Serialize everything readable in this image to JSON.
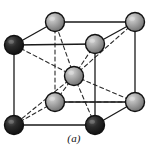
{
  "figure": {
    "caption": "(a)",
    "background_color": "#ffffff",
    "edge_color": "#1a1a1a",
    "hidden_edge_color": "#2a2a2a",
    "solid_edge_width": 1.3,
    "dashed_edge_width": 1.1,
    "dash_pattern": "4,3",
    "atom_outline_color": "#111111",
    "atom_fill_light": "#b3b3b3",
    "atom_fill_dark": "#1f1f1f",
    "atom_highlight_color": "#e0e0e0",
    "atom_radius": 9.5,
    "center_atom_radius": 9.5
  },
  "atoms": [
    {
      "id": "top-back-left",
      "name": "corner-atom-top-back-left",
      "cx": 55,
      "cy": 22,
      "shade": "light",
      "r": 9.5
    },
    {
      "id": "top-back-right",
      "name": "corner-atom-top-back-right",
      "cx": 135,
      "cy": 22,
      "shade": "light",
      "r": 9.5
    },
    {
      "id": "top-front-left",
      "name": "corner-atom-top-front-left",
      "cx": 14,
      "cy": 45,
      "shade": "dark",
      "r": 9.5
    },
    {
      "id": "top-front-right",
      "name": "corner-atom-top-front-right",
      "cx": 95,
      "cy": 44,
      "shade": "light",
      "r": 9.5
    },
    {
      "id": "body-center",
      "name": "body-center-atom",
      "cx": 74,
      "cy": 76,
      "shade": "light",
      "r": 9.5
    },
    {
      "id": "bottom-back-left",
      "name": "corner-atom-bottom-back-left",
      "cx": 55,
      "cy": 102,
      "shade": "light",
      "r": 9.5
    },
    {
      "id": "bottom-back-right",
      "name": "corner-atom-bottom-back-right",
      "cx": 135,
      "cy": 102,
      "shade": "light",
      "r": 9.5
    },
    {
      "id": "bottom-front-left",
      "name": "corner-atom-bottom-front-left",
      "cx": 14,
      "cy": 125,
      "shade": "dark",
      "r": 9.5
    },
    {
      "id": "bottom-front-right",
      "name": "corner-atom-bottom-front-right",
      "cx": 95,
      "cy": 125,
      "shade": "dark",
      "r": 9.5
    }
  ],
  "edges_solid": [
    {
      "name": "edge-top-back",
      "x1": 55,
      "y1": 22,
      "x2": 135,
      "y2": 22
    },
    {
      "name": "edge-top-left-diagonal",
      "x1": 14,
      "y1": 45,
      "x2": 55,
      "y2": 22
    },
    {
      "name": "edge-top-front",
      "x1": 14,
      "y1": 45,
      "x2": 95,
      "y2": 44
    },
    {
      "name": "edge-top-right-diagonal",
      "x1": 95,
      "y1": 44,
      "x2": 135,
      "y2": 22
    },
    {
      "name": "edge-vertical-front-left",
      "x1": 14,
      "y1": 45,
      "x2": 14,
      "y2": 125
    },
    {
      "name": "edge-vertical-front-right",
      "x1": 95,
      "y1": 44,
      "x2": 95,
      "y2": 125
    },
    {
      "name": "edge-vertical-back-right",
      "x1": 135,
      "y1": 22,
      "x2": 135,
      "y2": 102
    },
    {
      "name": "edge-bottom-front",
      "x1": 14,
      "y1": 125,
      "x2": 95,
      "y2": 125
    },
    {
      "name": "edge-bottom-right-diagonal",
      "x1": 95,
      "y1": 125,
      "x2": 135,
      "y2": 102
    },
    {
      "name": "edge-bottom-back",
      "x1": 55,
      "y1": 102,
      "x2": 135,
      "y2": 102
    }
  ],
  "edges_dashed": [
    {
      "name": "hidden-edge-vertical-back-left",
      "x1": 55,
      "y1": 22,
      "x2": 55,
      "y2": 102
    },
    {
      "name": "hidden-edge-bottom-left-diagonal",
      "x1": 14,
      "y1": 125,
      "x2": 55,
      "y2": 102
    },
    {
      "name": "hidden-edge-bottom-back-dashed",
      "x1": 55,
      "y1": 102,
      "x2": 135,
      "y2": 102
    }
  ],
  "diagonals_dashed": [
    {
      "name": "body-diagonal-to-top-back-left",
      "x1": 74,
      "y1": 76,
      "x2": 55,
      "y2": 22
    },
    {
      "name": "body-diagonal-to-top-back-right",
      "x1": 74,
      "y1": 76,
      "x2": 135,
      "y2": 22
    },
    {
      "name": "body-diagonal-to-top-front-left",
      "x1": 74,
      "y1": 76,
      "x2": 14,
      "y2": 45
    },
    {
      "name": "body-diagonal-to-top-front-right",
      "x1": 74,
      "y1": 76,
      "x2": 95,
      "y2": 44
    },
    {
      "name": "body-diagonal-to-bottom-back-left",
      "x1": 74,
      "y1": 76,
      "x2": 55,
      "y2": 102
    },
    {
      "name": "body-diagonal-to-bottom-back-right",
      "x1": 74,
      "y1": 76,
      "x2": 135,
      "y2": 102
    },
    {
      "name": "body-diagonal-to-bottom-front-left",
      "x1": 74,
      "y1": 76,
      "x2": 14,
      "y2": 125
    },
    {
      "name": "body-diagonal-to-bottom-front-right",
      "x1": 74,
      "y1": 76,
      "x2": 95,
      "y2": 125
    }
  ]
}
